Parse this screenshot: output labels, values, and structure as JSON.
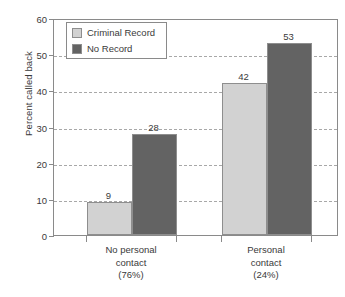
{
  "chart_data": {
    "type": "bar",
    "title": "",
    "xlabel": "",
    "ylabel": "Percent called back",
    "ylim": [
      0,
      60
    ],
    "ytick_step": 10,
    "yticks": [
      0,
      10,
      20,
      30,
      40,
      50,
      60
    ],
    "ytick_labels": [
      "0",
      "10",
      "20",
      "30",
      "40",
      "50",
      "60"
    ],
    "grid": "horizontal-dashed",
    "legend_position": "top-left-inside",
    "categories": [
      "No personal contact (76%)",
      "Personal contact (24%)"
    ],
    "category_lines": [
      [
        "No personal",
        "contact",
        "(76%)"
      ],
      [
        "Personal",
        "contact",
        "(24%)"
      ]
    ],
    "series": [
      {
        "name": "Criminal Record",
        "color": "#d2d2d2",
        "values": [
          9,
          42
        ],
        "value_labels": [
          "9",
          "42"
        ]
      },
      {
        "name": "No Record",
        "color": "#636363",
        "values": [
          28,
          53
        ],
        "value_labels": [
          "28",
          "53"
        ]
      }
    ],
    "colors": {
      "criminal_record": "#d2d2d2",
      "no_record": "#636363",
      "axis": "#8a8a8a",
      "grid": "#a8a8a8",
      "text": "#3a3a3a",
      "background": "#ffffff"
    }
  },
  "legend": {
    "items": [
      {
        "label": "Criminal Record",
        "color": "#d2d2d2"
      },
      {
        "label": "No Record",
        "color": "#636363"
      }
    ]
  },
  "caption": {
    "clipped_text": ""
  }
}
